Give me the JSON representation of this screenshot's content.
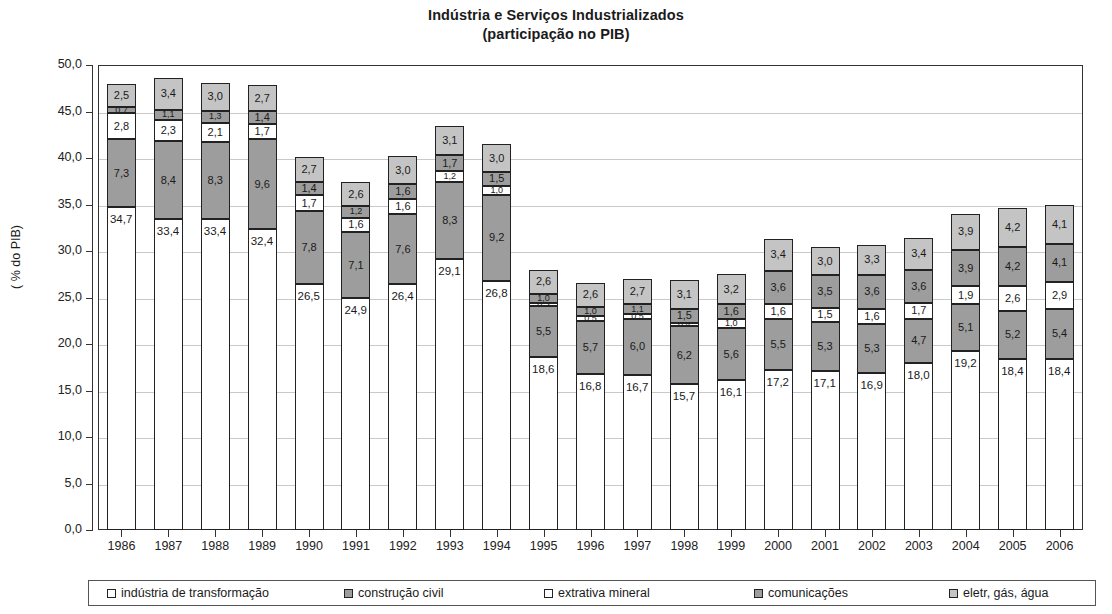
{
  "chart_data": {
    "type": "bar",
    "stacked": true,
    "title": "Indústria e Serviços Industrializados",
    "subtitle": "(participação no PIB)",
    "xlabel": "",
    "ylabel": "( % do PIB)",
    "ylim": [
      0,
      50
    ],
    "ytick_step": 5,
    "ytick_labels": [
      "0,0",
      "5,0",
      "10,0",
      "15,0",
      "20,0",
      "25,0",
      "30,0",
      "35,0",
      "40,0",
      "45,0",
      "50,0"
    ],
    "grid": true,
    "legend_position": "bottom",
    "decimal_separator": ",",
    "categories": [
      "1986",
      "1987",
      "1988",
      "1989",
      "1990",
      "1991",
      "1992",
      "1993",
      "1994",
      "1995",
      "1996",
      "1997",
      "1998",
      "1999",
      "2000",
      "2001",
      "2002",
      "2003",
      "2004",
      "2005",
      "2006"
    ],
    "series": [
      {
        "name": "indústria de transformação",
        "color": "#ffffff",
        "swatch": "sw-white",
        "values": [
          34.7,
          33.4,
          33.4,
          32.4,
          26.5,
          24.9,
          26.4,
          29.1,
          26.8,
          18.6,
          16.8,
          16.7,
          15.7,
          16.1,
          17.2,
          17.1,
          16.9,
          18.0,
          19.2,
          18.4,
          18.4
        ],
        "labels": [
          "34,7",
          "33,4",
          "33,4",
          "32,4",
          "26,5",
          "24,9",
          "26,4",
          "29,1",
          "26,8",
          "18,6",
          "16,8",
          "16,7",
          "15,7",
          "16,1",
          "17,2",
          "17,1",
          "16,9",
          "18,0",
          "19,2",
          "18,4",
          "18,4"
        ]
      },
      {
        "name": "construção civil",
        "color": "#9d9d9d",
        "swatch": "sw-gray",
        "values": [
          7.3,
          8.4,
          8.3,
          9.6,
          7.8,
          7.1,
          7.6,
          8.3,
          9.2,
          5.5,
          5.7,
          6.0,
          6.2,
          5.6,
          5.5,
          5.3,
          5.3,
          4.7,
          5.1,
          5.2,
          5.4
        ],
        "labels": [
          "7,3",
          "8,4",
          "8,3",
          "9,6",
          "7,8",
          "7,1",
          "7,6",
          "8,3",
          "9,2",
          "5,5",
          "5,7",
          "6,0",
          "6,2",
          "5,6",
          "5,5",
          "5,3",
          "5,3",
          "4,7",
          "5,1",
          "5,2",
          "5,4"
        ]
      },
      {
        "name": "extrativa mineral",
        "color": "#ffffff",
        "swatch": "sw-white",
        "values": [
          2.8,
          2.3,
          2.1,
          1.7,
          1.7,
          1.6,
          1.6,
          1.2,
          1.0,
          0.3,
          0.5,
          0.5,
          0.4,
          1.0,
          1.6,
          1.5,
          1.6,
          1.7,
          1.9,
          2.6,
          2.9
        ],
        "labels": [
          "2,8",
          "2,3",
          "2,1",
          "1,7",
          "1,7",
          "1,6",
          "1,6",
          "1,2",
          "1,0",
          "0,3",
          "0,5",
          "0,5",
          "0,4",
          "1,0",
          "1,6",
          "1,5",
          "1,6",
          "1,7",
          "1,9",
          "2,6",
          "2,9"
        ]
      },
      {
        "name": "comunicações",
        "color": "#9d9d9d",
        "swatch": "sw-gray",
        "values": [
          0.7,
          1.1,
          1.3,
          1.4,
          1.4,
          1.2,
          1.6,
          1.7,
          1.5,
          1.0,
          1.0,
          1.1,
          1.5,
          1.6,
          3.6,
          3.5,
          3.6,
          3.6,
          3.9,
          4.2,
          4.1
        ],
        "labels": [
          "0,7",
          "1,1",
          "1,3",
          "1,4",
          "1,4",
          "1,2",
          "1,6",
          "1,7",
          "1,5",
          "1,0",
          "1,0",
          "1,1",
          "1,5",
          "1,6",
          "3,6",
          "3,5",
          "3,6",
          "3,6",
          "3,9",
          "4,2",
          "4,1"
        ]
      },
      {
        "name": "eletr, gás, água",
        "color": "#c4c4c4",
        "swatch": "sw-lightgray",
        "values": [
          2.5,
          3.4,
          3.0,
          2.7,
          2.7,
          2.6,
          3.0,
          3.1,
          3.0,
          2.6,
          2.6,
          2.7,
          3.1,
          3.2,
          3.4,
          3.0,
          3.3,
          3.4,
          3.9,
          4.2,
          4.1
        ],
        "labels": [
          "2,5",
          "3,4",
          "3,0",
          "2,7",
          "2,7",
          "2,6",
          "3,0",
          "3,1",
          "3,0",
          "2,6",
          "2,6",
          "2,7",
          "3,1",
          "3,2",
          "3,4",
          "3,0",
          "3,3",
          "3,4",
          "3,9",
          "4,2",
          "4,1"
        ]
      }
    ],
    "totals": [
      48.0,
      48.6,
      48.1,
      47.8,
      40.1,
      37.4,
      40.2,
      43.4,
      41.5,
      28.0,
      26.6,
      27.0,
      26.9,
      27.5,
      31.3,
      30.4,
      30.7,
      31.4,
      34.0,
      34.6,
      34.9
    ]
  },
  "legend": {
    "items": [
      {
        "label": "indústria de transformação",
        "swatch": "sw-white"
      },
      {
        "label": "construção civil",
        "swatch": "sw-gray"
      },
      {
        "label": "extrativa mineral",
        "swatch": "sw-white"
      },
      {
        "label": "comunicações",
        "swatch": "sw-gray"
      },
      {
        "label": "eletr, gás, água",
        "swatch": "sw-lightgray"
      }
    ]
  }
}
